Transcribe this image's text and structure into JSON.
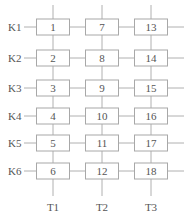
{
  "diagram": {
    "row_labels": [
      "K1",
      "K2",
      "K3",
      "K4",
      "K5",
      "K6"
    ],
    "column_labels": [
      "T1",
      "T2",
      "T3"
    ],
    "cells": [
      [
        "1",
        "7",
        "13"
      ],
      [
        "2",
        "8",
        "14"
      ],
      [
        "3",
        "9",
        "15"
      ],
      [
        "4",
        "10",
        "16"
      ],
      [
        "5",
        "11",
        "17"
      ],
      [
        "6",
        "12",
        "18"
      ]
    ],
    "colors": {
      "line": "#b0b0b0",
      "box_border": "#a8a8a8",
      "text": "#555555"
    }
  }
}
